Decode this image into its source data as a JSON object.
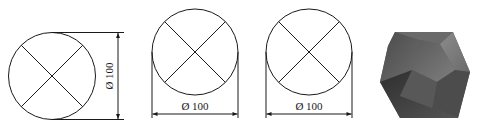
{
  "figures": [
    {
      "id": "circle-vertical-dim",
      "description": "Circle with X cross and vertical diameter dimension",
      "dimension": {
        "symbol": "Ø",
        "value": "100",
        "label": "Ø 100",
        "orientation": "vertical"
      }
    },
    {
      "id": "circle-horizontal-dim-1",
      "description": "Circle with X cross and horizontal diameter dimension below",
      "dimension": {
        "symbol": "Ø",
        "value": "100",
        "label": "Ø 100",
        "orientation": "horizontal"
      }
    },
    {
      "id": "circle-horizontal-dim-2",
      "description": "Circle with X cross and horizontal diameter dimension below",
      "dimension": {
        "symbol": "Ø",
        "value": "100",
        "label": "Ø 100",
        "orientation": "horizontal"
      }
    },
    {
      "id": "polyhedron",
      "description": "Shaded 3D faceted polyhedron (dodecahedron-like)"
    }
  ],
  "colors": {
    "line": "#1a1a1a",
    "background": "#ffffff",
    "shade_dark": "#3c3c3c",
    "shade_mid": "#6a6a6a",
    "shade_light": "#8a8a8a"
  }
}
